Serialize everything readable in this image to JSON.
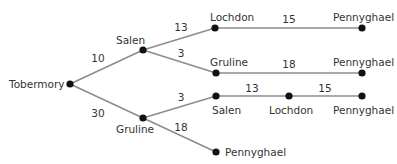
{
  "diagram": {
    "type": "tree",
    "root": "Tobermory",
    "colors": {
      "edge": "#8c8c8c",
      "node": "#111111",
      "text": "#333333"
    },
    "nodes": [
      {
        "id": "n0",
        "label": "Tobermory",
        "x": 70,
        "y": 84
      },
      {
        "id": "n1",
        "label": "Salen",
        "x": 143,
        "y": 50
      },
      {
        "id": "n2",
        "label": "Lochdon",
        "x": 215,
        "y": 28
      },
      {
        "id": "n3",
        "label": "Pennyghael",
        "x": 362,
        "y": 28
      },
      {
        "id": "n4",
        "label": "Gruline",
        "x": 216,
        "y": 73
      },
      {
        "id": "n5",
        "label": "Pennyghael",
        "x": 362,
        "y": 73
      },
      {
        "id": "n6",
        "label": "Gruline",
        "x": 143,
        "y": 118
      },
      {
        "id": "n7",
        "label": "Salen",
        "x": 216,
        "y": 96
      },
      {
        "id": "n8",
        "label": "Lochdon",
        "x": 289,
        "y": 96
      },
      {
        "id": "n9",
        "label": "Pennyghael",
        "x": 362,
        "y": 96
      },
      {
        "id": "n10",
        "label": "Pennyghael",
        "x": 216,
        "y": 152
      }
    ],
    "edges": [
      {
        "from": "n0",
        "to": "n1",
        "weight": "10"
      },
      {
        "from": "n1",
        "to": "n2",
        "weight": "13"
      },
      {
        "from": "n2",
        "to": "n3",
        "weight": "15"
      },
      {
        "from": "n1",
        "to": "n4",
        "weight": "3"
      },
      {
        "from": "n4",
        "to": "n5",
        "weight": "18"
      },
      {
        "from": "n0",
        "to": "n6",
        "weight": "30"
      },
      {
        "from": "n6",
        "to": "n7",
        "weight": "3"
      },
      {
        "from": "n7",
        "to": "n8",
        "weight": "13"
      },
      {
        "from": "n8",
        "to": "n9",
        "weight": "15"
      },
      {
        "from": "n6",
        "to": "n10",
        "weight": "18"
      }
    ]
  }
}
